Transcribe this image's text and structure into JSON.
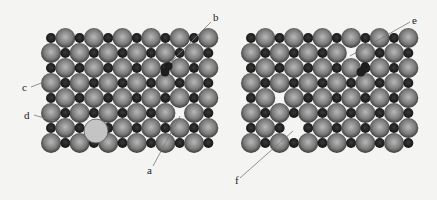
{
  "figure": {
    "colors": {
      "background": "#f4f4f2",
      "large_atom_center": "#b8b8b8",
      "large_atom_edge": "#3a3a3a",
      "small_atom": "#1e1e1e",
      "substitutional_atom": "#c4c4c4",
      "leader_line": "#777777"
    },
    "lattice": {
      "rows": 8,
      "cols": 6,
      "row_spacing": 15,
      "col_spacing": 28.6,
      "large_radius": 10,
      "small_radius": 5
    },
    "panels": [
      {
        "id": "left",
        "origin_x": 51,
        "origin_y": 38,
        "vacancies": [
          {
            "row": 5,
            "x": 179.5
          }
        ],
        "interstitials": [
          {
            "x": 165,
            "y": 72,
            "r": 4.5
          },
          {
            "x": 168.5,
            "y": 66,
            "r": 4
          }
        ],
        "substitutions": [
          {
            "x": 96,
            "y": 131,
            "r": 12,
            "replaces": [
              {
                "row": 6,
                "x": 94
              }
            ]
          }
        ],
        "labels": [
          {
            "text": "a",
            "x": 147,
            "y": 174,
            "line": [
              153,
              166,
              180,
              116
            ]
          },
          {
            "text": "b",
            "x": 213,
            "y": 21,
            "line": [
              211,
              22,
              170,
              63
            ]
          },
          {
            "text": "c",
            "x": 22,
            "y": 91,
            "line": [
              31,
              87,
              44,
              82
            ]
          },
          {
            "text": "d",
            "x": 24,
            "y": 119,
            "line": [
              34,
              115,
              58,
              122
            ]
          }
        ]
      },
      {
        "id": "right",
        "origin_x": 251,
        "origin_y": 38,
        "vacancies": [
          {
            "row": 1,
            "x": 350.5
          },
          {
            "row": 4,
            "x": 279.5
          },
          {
            "row": 6,
            "x": 293.5
          }
        ],
        "interstitials": [
          {
            "x": 361,
            "y": 72,
            "r": 4.5
          },
          {
            "x": 365,
            "y": 66,
            "r": 4
          }
        ],
        "substitutions": [],
        "labels": [
          {
            "text": "e",
            "x": 412,
            "y": 24,
            "line": [
              410,
              22,
              350,
              56
            ]
          },
          {
            "text": "f",
            "x": 235,
            "y": 184,
            "line": [
              240,
              178,
              293,
              131
            ]
          }
        ]
      }
    ]
  }
}
